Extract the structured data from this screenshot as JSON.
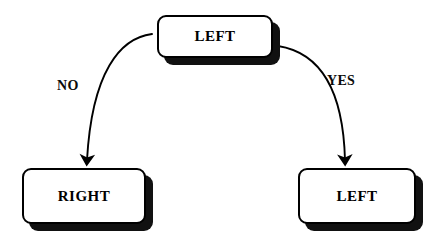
{
  "diagram": {
    "type": "flowchart",
    "background_color": "#ffffff",
    "border_color": "#000000",
    "shadow_color": "#111111",
    "nodes": [
      {
        "id": "top",
        "label": "LEFT",
        "role": "decision-source",
        "shape": "rounded-rectangle",
        "x": 157,
        "y": 15,
        "width": 116,
        "height": 43
      },
      {
        "id": "bottom-left",
        "label": "RIGHT",
        "role": "outcome",
        "shape": "rounded-rectangle",
        "x": 22,
        "y": 168,
        "width": 124,
        "height": 56
      },
      {
        "id": "bottom-right",
        "label": "LEFT",
        "role": "outcome",
        "shape": "rounded-rectangle",
        "x": 298,
        "y": 168,
        "width": 118,
        "height": 56
      }
    ],
    "edges": [
      {
        "id": "edge-no",
        "label": "NO",
        "from": "top",
        "to": "bottom-left",
        "style": "curved-arrow",
        "label_x": 57,
        "label_y": 78
      },
      {
        "id": "edge-yes",
        "label": "YES",
        "from": "top",
        "to": "bottom-right",
        "style": "curved-arrow",
        "label_x": 327,
        "label_y": 73
      }
    ]
  }
}
